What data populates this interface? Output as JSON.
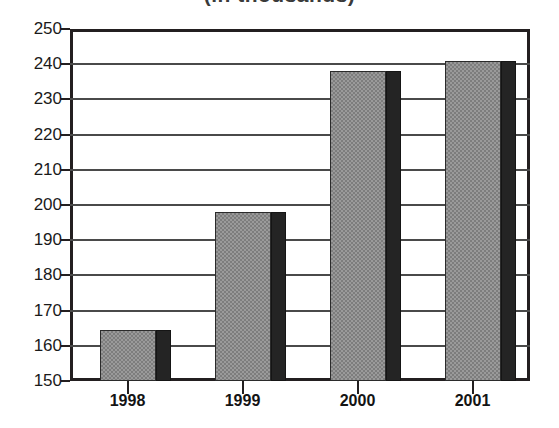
{
  "caption": {
    "remnant_text": "(in thousands)"
  },
  "chart_data": {
    "type": "bar",
    "title": "",
    "xlabel": "",
    "ylabel": "",
    "categories": [
      "1998",
      "1999",
      "2000",
      "2001"
    ],
    "values": [
      164.5,
      198,
      238,
      241
    ],
    "ylim": [
      150,
      250
    ],
    "yticks": [
      150,
      160,
      170,
      180,
      190,
      200,
      210,
      220,
      230,
      240,
      250
    ],
    "ytick_labels": [
      "150",
      "160",
      "170",
      "180",
      "190",
      "200",
      "210",
      "220",
      "230",
      "240",
      "250"
    ],
    "grid": true,
    "legend": null,
    "series": [
      {
        "name": "",
        "values": [
          164.5,
          198,
          238,
          241
        ]
      }
    ],
    "colors": {
      "bar_face": "#9a9a9a",
      "bar_face_pattern": "#7d7d7d",
      "bar_side": "#242424",
      "frame": "#231f20",
      "gridline": "#4a4a4a",
      "text": "#1a1a1a"
    }
  }
}
